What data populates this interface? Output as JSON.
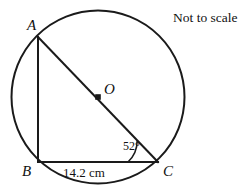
{
  "figure": {
    "note": "Not to scale",
    "stroke_color": "#1a1a1a",
    "background_color": "#ffffff",
    "circle": {
      "name": "circumscribed-circle",
      "center_label": "O",
      "cx": 98,
      "cy": 97,
      "r": 86.5
    },
    "points": [
      {
        "id": "A",
        "label": "A",
        "x": 38,
        "y": 37
      },
      {
        "id": "B",
        "label": "B",
        "x": 38,
        "y": 162
      },
      {
        "id": "C",
        "label": "C",
        "x": 158,
        "y": 162
      },
      {
        "id": "O",
        "label": "O",
        "x": 98,
        "y": 97
      }
    ],
    "segments": [
      {
        "name": "segment-ab",
        "from": "A",
        "to": "B"
      },
      {
        "name": "segment-bc",
        "from": "B",
        "to": "C"
      },
      {
        "name": "segment-ac-diameter",
        "from": "A",
        "to": "C"
      }
    ],
    "angle": {
      "name": "angle-acb",
      "vertex": "C",
      "value": "52°"
    },
    "measurement": {
      "name": "side-bc-length",
      "segment": "BC",
      "value": "14.2 cm"
    }
  }
}
